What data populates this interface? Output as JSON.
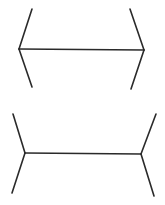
{
  "figure": {
    "type": "muller-lyer-illusion",
    "stroke_color": "#2a2a2a",
    "background": "#ffffff",
    "top": {
      "shaft": [
        19,
        49,
        144,
        50
      ],
      "fins": [
        [
          19,
          49,
          32,
          9
        ],
        [
          19,
          49,
          32,
          87
        ],
        [
          144,
          50,
          130,
          9
        ],
        [
          144,
          50,
          131,
          89
        ]
      ]
    },
    "bottom": {
      "shaft": [
        25,
        153,
        141,
        154
      ],
      "fins": [
        [
          25,
          153,
          13,
          114
        ],
        [
          25,
          153,
          12,
          193
        ],
        [
          141,
          154,
          156,
          114
        ],
        [
          141,
          154,
          154,
          196
        ]
      ]
    }
  }
}
